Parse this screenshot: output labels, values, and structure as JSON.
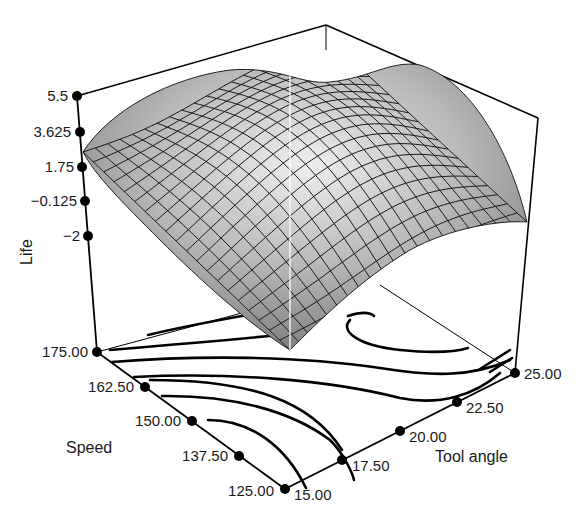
{
  "chart_data": {
    "type": "surface",
    "title": "",
    "subtitle": "",
    "zlabel": "Life",
    "xlabel": "Tool angle",
    "ylabel": "Speed",
    "z_ticks": [
      "5.5",
      "3.625",
      "1.75",
      "−0.125",
      "−2"
    ],
    "z_tick_values": [
      5.5,
      3.625,
      1.75,
      -0.125,
      -2
    ],
    "zlim": [
      -2,
      5.5
    ],
    "y_ticks": [
      "175.00",
      "162.50",
      "150.00",
      "137.50",
      "125.00"
    ],
    "y_tick_values": [
      175,
      162.5,
      150,
      137.5,
      125
    ],
    "ylim": [
      125,
      175
    ],
    "x_ticks": [
      "15.00",
      "17.50",
      "20.00",
      "22.50",
      "25.00"
    ],
    "x_tick_values": [
      15,
      17.5,
      20,
      22.5,
      25
    ],
    "xlim": [
      15,
      25
    ],
    "surface": {
      "description": "Response surface of Life vs Tool angle and Speed: saddle-like ridge peaking near mid tool angle and mid-high speed, dropping toward corners (low speed/low angle and high speed/high angle)",
      "shading": "gray gradient with black mesh",
      "mesh_lines": 20,
      "approx_peak": 5.5,
      "approx_min": -2
    },
    "contour_projection": {
      "on_floor": true,
      "line_color": "#000000",
      "levels_count": 7
    },
    "grid": false,
    "legend": null,
    "box": true
  },
  "colors": {
    "surface_light": "#e8e8e8",
    "surface_dark": "#7a7a7a",
    "mesh": "#1a1a1a",
    "axis": "#000000",
    "background": "#ffffff"
  }
}
